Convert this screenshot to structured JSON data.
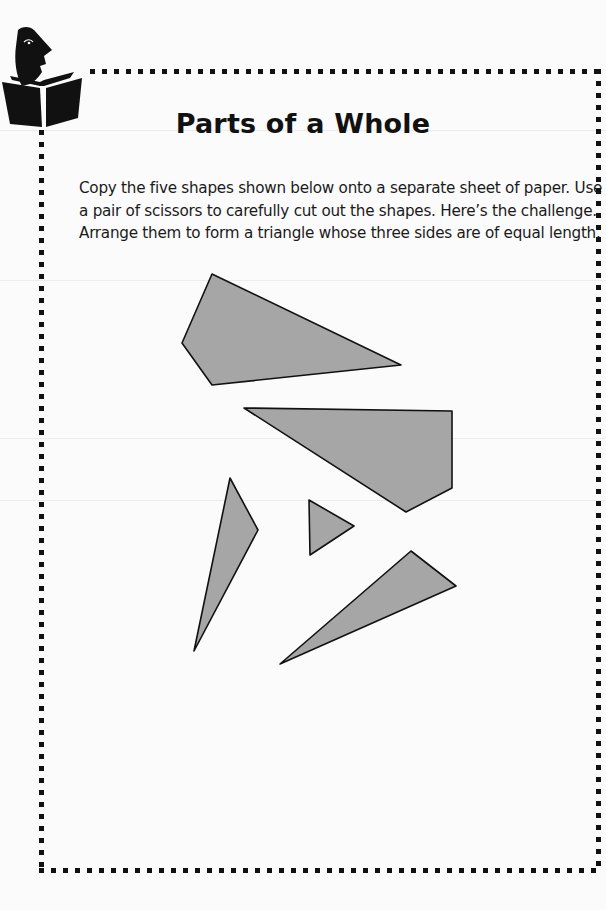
{
  "page": {
    "title": "Parts of a Whole",
    "instructions": [
      "Copy the five shapes shown below onto a separate sheet of paper. Use",
      "a pair of scissors to carefully cut out the shapes. Here’s the challenge.",
      "Arrange them to form a triangle whose three sides are of equal length."
    ],
    "header_icon": "reader-with-book-icon",
    "border": {
      "style": "dotted-square",
      "color": "#111111"
    }
  },
  "shapes": {
    "fill": "#a6a6a6",
    "stroke": "#111111",
    "items": [
      {
        "name": "pentagon-shape",
        "points": "212,274 182,343 212,385 401,365"
      },
      {
        "name": "hexagon-shape",
        "points": "244,408 452,411 452,488 406,512"
      },
      {
        "name": "thin-wedge-shape",
        "points": "230,478 258,530 194,651"
      },
      {
        "name": "small-triangle-shape",
        "points": "309,500 354,526 310,555"
      },
      {
        "name": "long-triangle-shape",
        "points": "411,551 456,586 280,664"
      }
    ]
  }
}
